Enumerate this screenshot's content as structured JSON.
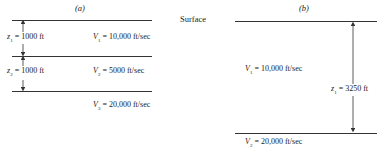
{
  "surface_label": "Surface",
  "panel_a": {
    "title": "(a)",
    "layers": [
      {
        "name": "layer-1",
        "velocity_label": "V",
        "velocity_sub": "1",
        "velocity_value": "= 10,000 ft/sec",
        "thickness_label": "z",
        "thickness_sub": "1",
        "thickness_value": "= 1000 ft"
      },
      {
        "name": "layer-2",
        "velocity_label": "V",
        "velocity_sub": "2",
        "velocity_value": "= 5000 ft/sec",
        "thickness_label": "z",
        "thickness_sub": "2",
        "thickness_value": "= 1000 ft"
      },
      {
        "name": "layer-3",
        "velocity_label": "V",
        "velocity_sub": "3",
        "velocity_value": "= 20,000 ft/sec"
      }
    ]
  },
  "panel_b": {
    "title": "(b)",
    "layers": [
      {
        "name": "layer-1",
        "velocity_label": "V",
        "velocity_sub": "1",
        "velocity_value": "= 10,000 ft/sec",
        "thickness_label": "z",
        "thickness_sub": "1",
        "thickness_value": "= 3250 ft"
      },
      {
        "name": "layer-2",
        "velocity_label": "V",
        "velocity_sub": "2",
        "velocity_value": "= 20,000 ft/sec"
      }
    ]
  }
}
